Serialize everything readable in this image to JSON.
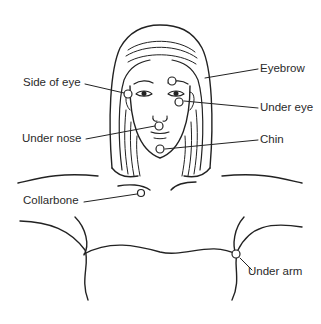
{
  "diagram": {
    "stroke_color": "#222222",
    "background_color": "#ffffff",
    "labels": {
      "side_of_eye": "Side of eye",
      "eyebrow": "Eyebrow",
      "under_eye": "Under eye",
      "under_nose": "Under nose",
      "chin": "Chin",
      "collarbone": "Collarbone",
      "under_arm": "Under arm"
    },
    "points": [
      {
        "name": "Side of eye",
        "x": 128,
        "y": 94
      },
      {
        "name": "Eyebrow",
        "x": 172,
        "y": 81
      },
      {
        "name": "Under eye",
        "x": 179,
        "y": 101
      },
      {
        "name": "Under nose",
        "x": 159,
        "y": 125
      },
      {
        "name": "Chin",
        "x": 160,
        "y": 149
      },
      {
        "name": "Collarbone",
        "x": 141,
        "y": 193
      },
      {
        "name": "Under arm",
        "x": 236,
        "y": 254
      }
    ]
  }
}
